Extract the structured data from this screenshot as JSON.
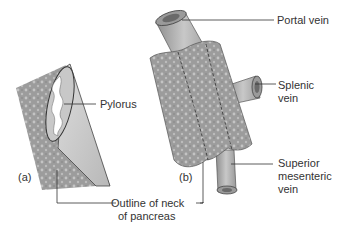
{
  "diagram": {
    "panels": [
      {
        "id": "a",
        "label": "(a)"
      },
      {
        "id": "b",
        "label": "(b)"
      }
    ],
    "labels": {
      "pylorus": "Pylorus",
      "portal_vein": "Portal vein",
      "splenic_vein_1": "Splenic",
      "splenic_vein_2": "vein",
      "superior_mesenteric_1": "Superior",
      "superior_mesenteric_2": "mesenteric",
      "superior_mesenteric_3": "vein",
      "outline_neck_1": "Outline of neck",
      "outline_neck_2": "of pancreas"
    },
    "colors": {
      "pancreas": "#9a9a9a",
      "vein": "#b5b5b5",
      "lumen": "#6a6a6a",
      "leader_line": "#333333",
      "text": "#333333"
    }
  }
}
